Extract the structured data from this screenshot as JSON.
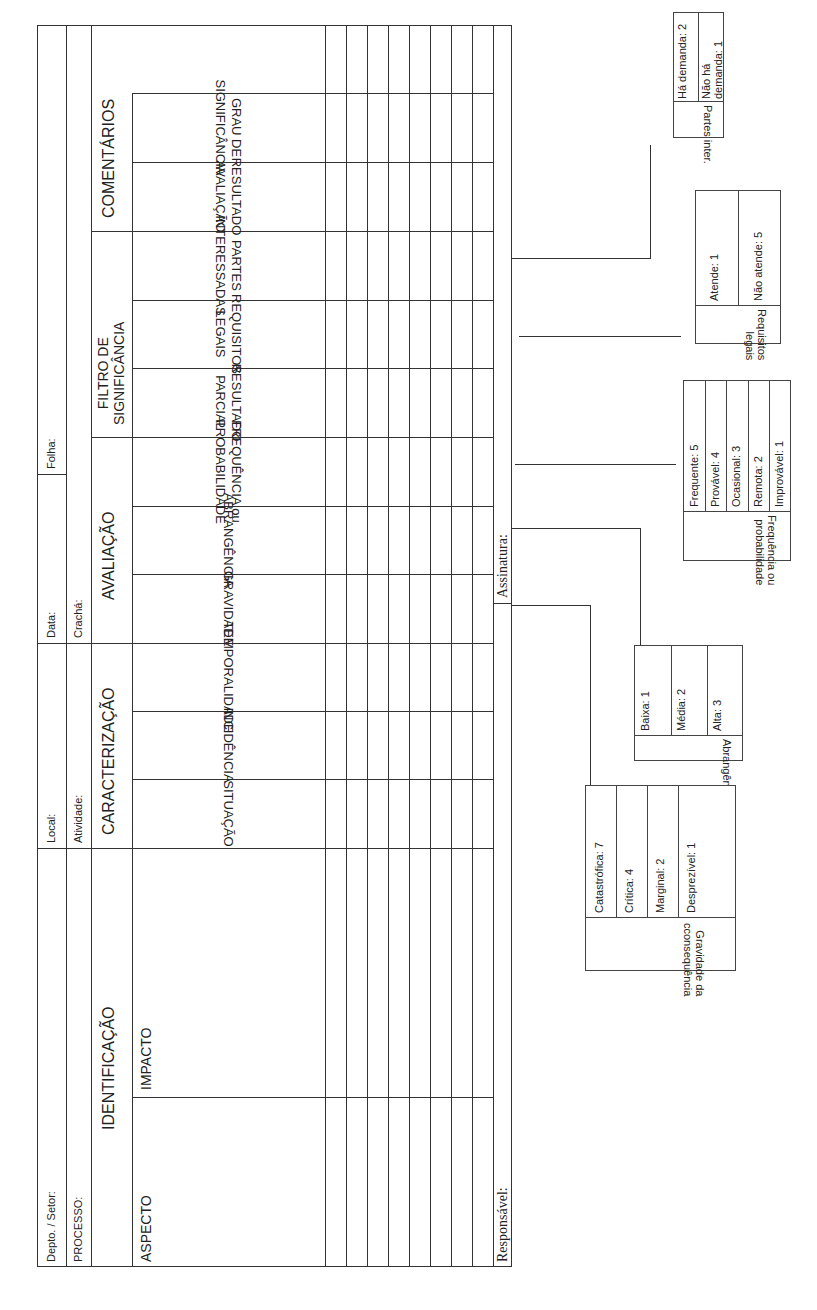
{
  "form": {
    "header": {
      "depto_setor": "Depto. / Setor:",
      "local": "Local:",
      "data": "Data:",
      "folha": "Folha:",
      "processo": "PROCESSO:",
      "atividade": "Atividade:",
      "cracha": "Crachá:"
    },
    "sections": {
      "identificacao": "IDENTIFICAÇÃO",
      "caracterizacao": "CARACTERIZAÇÃO",
      "avaliacao": "AVALIAÇÃO",
      "filtro": [
        "FILTRO DE",
        "SIGNIFICÂNCIA"
      ],
      "comentarios": "COMENTÁRIOS"
    },
    "columns": {
      "aspecto": "ASPECTO",
      "impacto": "IMPACTO",
      "situacao": "SITUAÇÃO",
      "incidencia": "INCIDÊNCIA",
      "temporalidade": "TEMPORALIDADE",
      "gravidade": "GRAVIDADE",
      "abrangencia": "ABRANGÊNCIA",
      "frequencia": [
        "FREQUÊNCIA ou",
        "PROBABILIDADE"
      ],
      "resultado_parcial": [
        "RESULTADO",
        "PARCIAL"
      ],
      "requisitos_legais": [
        "REQUISITOS",
        "LEGAIS"
      ],
      "partes_interessadas": [
        "PARTES",
        "INTERESSADAS"
      ],
      "resultado_avaliacao": [
        "RESULTADO",
        "AVALIAÇÃO"
      ],
      "grau_significancia": [
        "GRAU DE",
        "SIGNIFICÂNCIA"
      ],
      "comentarios_blank": ""
    },
    "blank_rows": 8,
    "footer": {
      "responsavel": "Responsável:",
      "assinatura": "Assinatura:"
    }
  },
  "legends": {
    "partes_inter": {
      "title": "Partes inter.",
      "items": [
        "Há demanda: 2",
        "Não há demanda: 1"
      ]
    },
    "requisitos_legais": {
      "title": [
        "Requisitos",
        "legais"
      ],
      "items": [
        "Atende: 1",
        "Não atende: 5"
      ]
    },
    "frequencia": {
      "title": [
        "Frequência ou",
        "probabilidade"
      ],
      "items": [
        "Frequente: 5",
        "Provável: 4",
        "Ocasional: 3",
        "Remota: 2",
        "Improvável: 1"
      ]
    },
    "abrangencia": {
      "title": "Abrangência",
      "items": [
        "Baixa: 1",
        "Média: 2",
        "Alta: 3"
      ]
    },
    "gravidade": {
      "title": [
        "Gravidade da",
        "cconsequência"
      ],
      "items": [
        "Catastrófica: 7",
        "Crítica: 4",
        "Marginal: 2",
        "Desprezível: 1"
      ]
    }
  }
}
